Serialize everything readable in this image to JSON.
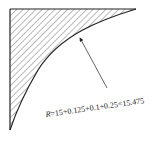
{
  "figure": {
    "annotation": {
      "variable": "R",
      "expression": "=15+0.125+0.1+0.25=15.475"
    },
    "colors": {
      "line": "#222222",
      "hatch": "#555555",
      "background": "#ffffff"
    }
  }
}
